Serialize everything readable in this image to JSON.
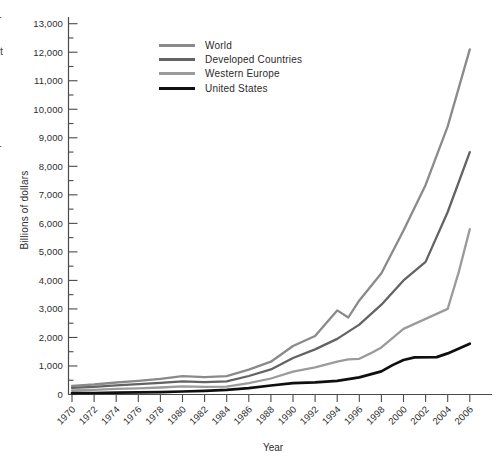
{
  "figure": {
    "y_axis_label": "Billions of dollars",
    "x_axis_label": "Year",
    "edge_artifacts": [
      "-",
      "t",
      "-"
    ]
  },
  "chart_data": {
    "type": "line",
    "title": "",
    "xlabel": "Year",
    "ylabel": "Billions of dollars",
    "xlim": [
      1970,
      2006
    ],
    "ylim": [
      0,
      13000
    ],
    "grid": false,
    "legend_position": "top-left-inside",
    "x_ticks": [
      "1970",
      "1972",
      "1974",
      "1976",
      "1978",
      "1980",
      "1982",
      "1984",
      "1986",
      "1988",
      "1990",
      "1992",
      "1994",
      "1996",
      "1998",
      "2000",
      "2002",
      "2004",
      "2006"
    ],
    "y_ticks": [
      "0",
      "1,000",
      "2,000",
      "3,000",
      "4,000",
      "5,000",
      "6,000",
      "7,000",
      "8,000",
      "9,000",
      "10,000",
      "11,000",
      "12,000",
      "13,000"
    ],
    "y_minor_tick_step": 500,
    "axis_color": "#4a4a4a",
    "series": [
      {
        "name": "World",
        "color": "#8a8a8a",
        "line_width": 2.3,
        "points": [
          [
            1970,
            300
          ],
          [
            1972,
            350
          ],
          [
            1974,
            420
          ],
          [
            1976,
            480
          ],
          [
            1978,
            550
          ],
          [
            1980,
            640
          ],
          [
            1982,
            610
          ],
          [
            1984,
            640
          ],
          [
            1986,
            870
          ],
          [
            1988,
            1150
          ],
          [
            1990,
            1700
          ],
          [
            1992,
            2050
          ],
          [
            1993,
            2500
          ],
          [
            1994,
            2950
          ],
          [
            1995,
            2700
          ],
          [
            1996,
            3300
          ],
          [
            1998,
            4250
          ],
          [
            2000,
            5750
          ],
          [
            2002,
            7350
          ],
          [
            2004,
            9400
          ],
          [
            2006,
            12100
          ]
        ]
      },
      {
        "name": "Developed Countries",
        "color": "#636363",
        "line_width": 2.3,
        "points": [
          [
            1970,
            230
          ],
          [
            1972,
            265
          ],
          [
            1974,
            320
          ],
          [
            1976,
            360
          ],
          [
            1978,
            410
          ],
          [
            1980,
            460
          ],
          [
            1982,
            435
          ],
          [
            1984,
            460
          ],
          [
            1986,
            650
          ],
          [
            1988,
            880
          ],
          [
            1990,
            1280
          ],
          [
            1992,
            1580
          ],
          [
            1994,
            1950
          ],
          [
            1996,
            2450
          ],
          [
            1998,
            3150
          ],
          [
            2000,
            4000
          ],
          [
            2002,
            4650
          ],
          [
            2004,
            6400
          ],
          [
            2006,
            8500
          ]
        ]
      },
      {
        "name": "Western Europe",
        "color": "#9b9b9b",
        "line_width": 2.3,
        "points": [
          [
            1970,
            140
          ],
          [
            1972,
            160
          ],
          [
            1974,
            195
          ],
          [
            1976,
            215
          ],
          [
            1978,
            245
          ],
          [
            1980,
            285
          ],
          [
            1982,
            265
          ],
          [
            1984,
            275
          ],
          [
            1986,
            395
          ],
          [
            1988,
            560
          ],
          [
            1990,
            800
          ],
          [
            1992,
            950
          ],
          [
            1994,
            1150
          ],
          [
            1995,
            1230
          ],
          [
            1996,
            1250
          ],
          [
            1997,
            1440
          ],
          [
            1998,
            1650
          ],
          [
            2000,
            2300
          ],
          [
            2002,
            2650
          ],
          [
            2004,
            3000
          ],
          [
            2005,
            4300
          ],
          [
            2006,
            5800
          ]
        ]
      },
      {
        "name": "United States",
        "color": "#0f0f0f",
        "line_width": 2.7,
        "points": [
          [
            1970,
            45
          ],
          [
            1972,
            52
          ],
          [
            1974,
            62
          ],
          [
            1976,
            72
          ],
          [
            1978,
            85
          ],
          [
            1980,
            105
          ],
          [
            1982,
            130
          ],
          [
            1984,
            165
          ],
          [
            1986,
            220
          ],
          [
            1988,
            314
          ],
          [
            1990,
            395
          ],
          [
            1992,
            425
          ],
          [
            1994,
            480
          ],
          [
            1996,
            600
          ],
          [
            1998,
            810
          ],
          [
            1999,
            1030
          ],
          [
            2000,
            1210
          ],
          [
            2001,
            1300
          ],
          [
            2003,
            1310
          ],
          [
            2004,
            1440
          ],
          [
            2006,
            1780
          ]
        ]
      }
    ]
  }
}
